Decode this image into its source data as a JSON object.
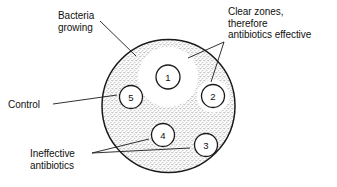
{
  "figure": {
    "background_color": "#ffffff",
    "line_color": "#1a1a1a",
    "lawn_color": "#8a8a8a",
    "clear_zone_color": "#ffffff",
    "width": 337,
    "height": 187
  },
  "dish": {
    "name": "agar-plate",
    "center_x": 168.5,
    "center_y": 106,
    "radius": 66.5,
    "fill_description": "stippled bacterial lawn"
  },
  "annotations": [
    {
      "id": "bacteria-growing",
      "lines": [
        "Bacteria",
        "growing"
      ],
      "text": "Bacteria growing",
      "x": 58,
      "y": 10,
      "align": "left",
      "leaders": [
        {
          "x1": 100,
          "y1": 21,
          "x2": 136,
          "y2": 56
        }
      ]
    },
    {
      "id": "clear-zones",
      "lines": [
        "Clear zones,",
        "therefore",
        "antibiotics effective"
      ],
      "text": "Clear zones, therefore antibiotics effective",
      "x": 228,
      "y": 6,
      "align": "left",
      "leaders": [
        {
          "x1": 224,
          "y1": 42,
          "x2": 188,
          "y2": 58
        },
        {
          "x1": 224,
          "y1": 42,
          "x2": 211,
          "y2": 82
        }
      ]
    },
    {
      "id": "control",
      "lines": [
        "Control"
      ],
      "text": "Control",
      "x": 8,
      "y": 99,
      "align": "left",
      "leaders": [
        {
          "x1": 53,
          "y1": 104,
          "x2": 117,
          "y2": 95
        }
      ]
    },
    {
      "id": "ineffective-antibiotics",
      "lines": [
        "Ineffective",
        "antibiotics"
      ],
      "text": "Ineffective antibiotics",
      "x": 30,
      "y": 148,
      "align": "left",
      "leaders": [
        {
          "x1": 92,
          "y1": 153,
          "x2": 149,
          "y2": 139
        },
        {
          "x1": 92,
          "y1": 153,
          "x2": 190,
          "y2": 148
        }
      ]
    }
  ],
  "discs": [
    {
      "label": "1",
      "name": "antibiotic-disc-1",
      "cx": 168,
      "cy": 77,
      "r": 12,
      "zone_r": 30,
      "has_clear_zone": true,
      "interpretation": "clear zone, antibiotic effective"
    },
    {
      "label": "2",
      "name": "antibiotic-disc-2",
      "cx": 213,
      "cy": 96,
      "r": 11.5,
      "zone_r": 16.5,
      "has_clear_zone": true,
      "interpretation": "clear zone, antibiotic effective"
    },
    {
      "label": "3",
      "name": "antibiotic-disc-3",
      "cx": 206,
      "cy": 145,
      "r": 11.5,
      "zone_r": 0,
      "has_clear_zone": false,
      "interpretation": "no clear zone, antibiotic ineffective"
    },
    {
      "label": "4",
      "name": "antibiotic-disc-4",
      "cx": 163,
      "cy": 135,
      "r": 11.5,
      "zone_r": 0,
      "has_clear_zone": false,
      "interpretation": "no clear zone, antibiotic ineffective"
    },
    {
      "label": "5",
      "name": "control-disc-5",
      "cx": 131,
      "cy": 97,
      "r": 11.5,
      "zone_r": 0,
      "has_clear_zone": false,
      "interpretation": "control disc"
    }
  ]
}
